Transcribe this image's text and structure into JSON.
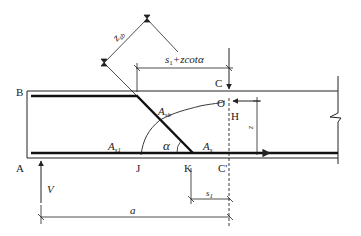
{
  "diagram": {
    "type": "beam shear reinforcement free-body diagram",
    "points": {
      "A": "A",
      "B": "B",
      "C": "C",
      "C_prime": "C'",
      "O": "O",
      "H": "H",
      "J": "J",
      "K": "K"
    },
    "labels": {
      "z_sb": "z",
      "z_sb_sub": "sb",
      "s1_plus_zcot": "s",
      "s1_plus_zcot_sub": "1",
      "s1_plus_zcot_rest": "+zcot",
      "alpha": "α",
      "A_sb": "A",
      "A_sb_sub": "sb",
      "A_s1": "A",
      "A_s1_sub": "s1",
      "A_s": "A",
      "A_s_sub": "s",
      "V": "V",
      "a": "a",
      "s1": "s",
      "s1_sub": "1",
      "z": "z"
    },
    "colors": {
      "line": "#222222",
      "background": "#ffffff"
    }
  }
}
